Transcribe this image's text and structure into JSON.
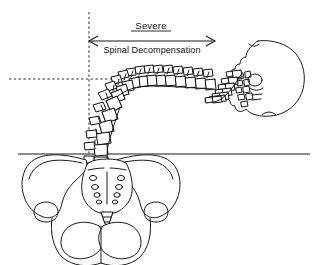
{
  "figure": {
    "kind": "medical-line-illustration",
    "view": "sagittal spine with frontal pelvis",
    "background_color": "#ffffff",
    "ink_color": "#1a1a1a",
    "width_px": 325,
    "height_px": 265
  },
  "annotations": {
    "title_label": "Severe",
    "subtitle_label": "Spinal Decompensation",
    "vertebra_label": "C7"
  },
  "measurement": {
    "arrow_style": "double-headed",
    "start_x": 89,
    "end_x": 215,
    "y": 41
  },
  "reference_lines": {
    "plumb_line": {
      "orientation": "vertical",
      "style": "dashed",
      "x": 89,
      "y_start": 12,
      "y_end": 178
    },
    "apex_line": {
      "orientation": "horizontal",
      "style": "dashed",
      "y": 79,
      "x_start": 9,
      "x_end": 116
    },
    "ground_line": {
      "orientation": "horizontal",
      "style": "solid",
      "y": 154,
      "x_start": 18,
      "x_end": 310
    }
  },
  "anatomy": {
    "skull": {
      "name": "skull",
      "view": "lateral",
      "facing": "left",
      "center_x": 268,
      "center_y": 77
    },
    "cervical_spine": {
      "name": "cervical-spine",
      "vertebra_count": 7,
      "terminal_vertebra": "C7"
    },
    "thoracic_spine": {
      "name": "thoracic-spine",
      "vertebra_count": 12,
      "orientation": "near-horizontal"
    },
    "lumbar_spine": {
      "name": "lumbar-spine",
      "vertebra_count": 5,
      "orientation": "steep-diagonal"
    },
    "pelvis": {
      "name": "pelvis",
      "view": "frontal",
      "parts": [
        "left-ilium",
        "right-ilium",
        "sacrum",
        "coccyx",
        "pubis",
        "obturator-foramina"
      ]
    }
  }
}
